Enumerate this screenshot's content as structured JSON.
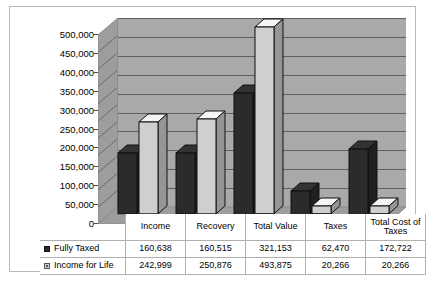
{
  "chart_data": {
    "type": "bar",
    "title": "",
    "subtitle": "",
    "xlabel": "",
    "ylabel": "",
    "ylim": [
      0,
      500000
    ],
    "ytick_step": 50000,
    "grid": true,
    "legend_position": "table-left",
    "three_d": true,
    "categories": [
      "Income",
      "Recovery",
      "Total Value",
      "Taxes",
      "Total Cost of Taxes"
    ],
    "ytick_labels": [
      "500,000",
      "450,000",
      "400,000",
      "350,000",
      "300,000",
      "250,000",
      "200,000",
      "150,000",
      "100,000",
      "50,000",
      "0"
    ],
    "ytick_values": [
      500000,
      450000,
      400000,
      350000,
      300000,
      250000,
      200000,
      150000,
      100000,
      50000,
      0
    ],
    "series": [
      {
        "name": "Fully Taxed",
        "color": "#2b2b2b",
        "values": [
          160638,
          160515,
          321153,
          62470,
          172722
        ],
        "labels": [
          "160,638",
          "160,515",
          "321,153",
          "62,470",
          "172,722"
        ]
      },
      {
        "name": "Income for Life",
        "color": "#cfcfcf",
        "values": [
          242999,
          250876,
          493875,
          20266,
          20266
        ],
        "labels": [
          "242,999",
          "250,876",
          "493,875",
          "20,266",
          "20,266"
        ]
      }
    ]
  },
  "colors": {
    "plot_background": "#a9a9a9",
    "gridline": "#5e5e5e",
    "frame_border": "#b9b9b9",
    "series_fully_taxed": "#2b2b2b",
    "series_income_for_life": "#cfcfcf",
    "page_background": "#ffffff"
  },
  "table": {
    "header_row": [
      "",
      "Income",
      "Recovery",
      "Total Value",
      "Taxes",
      "Total Cost of Taxes"
    ],
    "rows": [
      {
        "label": "Fully Taxed",
        "swatch": "dark-square-marker",
        "cells": [
          "160,638",
          "160,515",
          "321,153",
          "62,470",
          "172,722"
        ]
      },
      {
        "label": "Income for Life",
        "swatch": "light-square-marker",
        "cells": [
          "242,999",
          "250,876",
          "493,875",
          "20,266",
          "20,266"
        ]
      }
    ]
  }
}
